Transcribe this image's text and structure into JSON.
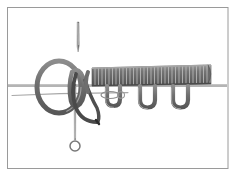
{
  "figure": {
    "title": "Rope whipping and loop knot illustration"
  },
  "frame": {
    "name": "figure-border",
    "stroke_color": "#9a9a9a",
    "stroke_width": 1,
    "left": 7,
    "top": 7,
    "right": 228,
    "bottom": 168,
    "background": "#ffffff"
  },
  "colors": {
    "background": "#ffffff",
    "rope_fill": "#6e6e6e",
    "rope_fill_light": "#8c8c8c",
    "rope_stroke": "#4a4a4a",
    "rope_dark": "#3a3a3a",
    "coil_band": "#6b6b6b",
    "coil_gap": "#c9c9c9",
    "needle_light": "#b9b9b9",
    "needle_mid": "#8f8f8f",
    "needle_dark": "#555555",
    "baseline_stroke": "#9b9b9b",
    "frame_stroke": "#9a9a9a"
  },
  "elements": {
    "upper_needle": {
      "label": "upper-needle",
      "x": 78,
      "tip_y": 52,
      "head_y": 22,
      "length": 30,
      "width": 2
    },
    "lower_needle": {
      "label": "lower-needle-with-ring-eye",
      "x": 75,
      "top_y": 84,
      "ring_center_y": 146,
      "ring_radius": 5,
      "shaft_width": 2
    },
    "big_loop": {
      "label": "large-rope-loop",
      "center_x": 59,
      "center_y": 87,
      "radius_x": 22,
      "radius_y": 26,
      "stroke_width": 5
    },
    "inner_loop": {
      "label": "inner-rope-loop",
      "center_x": 78,
      "center_y": 92,
      "radius_x": 9,
      "radius_y": 17,
      "stroke_width": 5
    },
    "coil": {
      "label": "whipped-coil-section",
      "start_x": 92,
      "end_x": 211,
      "top_y": 67,
      "bottom_y": 85,
      "turn_count": 34,
      "turn_pitch": 3.5
    },
    "baseline": {
      "label": "horizontal-core-line",
      "y": 86,
      "x_start": 8,
      "x_end": 227,
      "stroke_width": 1.4
    },
    "secondary_line": {
      "label": "secondary-wire-line",
      "y": 94,
      "x_start": 12,
      "x_end": 125,
      "stroke_width": 1
    },
    "bights": [
      {
        "label": "hanging-bight-1",
        "center_x": 113,
        "top_y": 86,
        "bottom_y": 106,
        "half_width": 7
      },
      {
        "label": "hanging-bight-2",
        "center_x": 147,
        "top_y": 86,
        "bottom_y": 107,
        "half_width": 8
      },
      {
        "label": "hanging-bight-3",
        "center_x": 180,
        "top_y": 86,
        "bottom_y": 107,
        "half_width": 8
      }
    ],
    "dark_strand": {
      "label": "dark-working-end-strand",
      "start_x": 76,
      "start_y": 75,
      "end_x": 98,
      "end_y": 123
    }
  }
}
